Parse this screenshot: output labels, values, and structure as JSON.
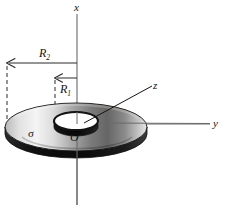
{
  "figure": {
    "background_color": "#ffffff",
    "width": 225,
    "height": 213
  },
  "axes": {
    "x": {
      "label": "x",
      "orientation": "vertical-up"
    },
    "y": {
      "label": "y",
      "orientation": "horizontal-right"
    },
    "z": {
      "label": "z",
      "orientation": "oblique-out-of-page"
    }
  },
  "labels": {
    "origin": "O",
    "surface_charge_density": "σ",
    "outer_radius": {
      "symbol": "R",
      "subscript": "2"
    },
    "inner_radius": {
      "symbol": "R",
      "subscript": "1"
    }
  },
  "colors": {
    "stroke": "#16130f",
    "disk_light": "#f2f2f2",
    "disk_mid": "#9a9a9a",
    "disk_dark": "#3a3a3a",
    "edge_dark": "#141414",
    "dashed": "#2a2a2a"
  },
  "geometry": {
    "disk_center": {
      "x": 76,
      "y": 127
    },
    "outer_radius_x": 71,
    "outer_radius_y": 24,
    "inner_radius_x": 22,
    "inner_radius_y": 9,
    "disk_thickness": 7,
    "x_axis_line": {
      "x": 77,
      "y_top": 14,
      "y_bottom": 205
    },
    "y_axis_line": {
      "y": 124,
      "x_left": 77,
      "x_right": 210
    },
    "z_axis_line": {
      "x1": 82,
      "y1": 124,
      "x2": 152,
      "y2": 86
    },
    "r2_dashed": {
      "x": 7,
      "y_top": 66,
      "y_bottom": 120
    },
    "r1_dashed": {
      "x": 55,
      "y_top": 80,
      "y_bottom": 122
    },
    "r2_arrow": {
      "y": 63,
      "x_from": 77,
      "x_to": 7
    },
    "r1_arrow": {
      "y": 78,
      "x_from": 77,
      "x_to": 55
    }
  }
}
